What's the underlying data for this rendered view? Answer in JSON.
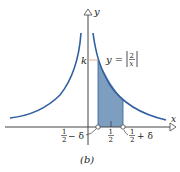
{
  "figure": {
    "caption": "(b)",
    "equation_label": "y = |2/x|",
    "equation_parts": {
      "lhs": "y =",
      "numerator": "2",
      "denominator": "x"
    },
    "k_label": "k",
    "axis_labels": {
      "x": "x",
      "y": "y"
    },
    "tick_labels": {
      "left": {
        "numerator": "1",
        "denominator": "2",
        "suffix": "− δ"
      },
      "center": {
        "numerator": "1",
        "denominator": "2"
      },
      "right": {
        "numerator": "1",
        "denominator": "2",
        "suffix": "+ δ"
      }
    },
    "colors": {
      "curve": "#2f5fa0",
      "shade": "#6f93b8",
      "axis": "#444444",
      "k_guide": "#d9a07a"
    }
  }
}
